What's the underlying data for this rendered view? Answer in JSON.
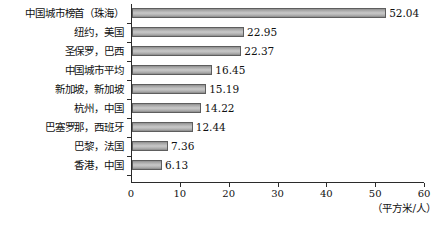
{
  "chart_data": {
    "type": "bar",
    "orientation": "horizontal",
    "title": "",
    "xlabel": "（平方米/人）",
    "ylabel": "",
    "xlim": [
      0,
      60
    ],
    "xticks": [
      "0",
      "10",
      "20",
      "30",
      "40",
      "50",
      "60"
    ],
    "xtick_values": [
      0,
      10,
      20,
      30,
      40,
      50,
      60
    ],
    "grid": false,
    "legend": false,
    "bar_color": "#b0b0b0",
    "bar_border_color": "#5e5e5e",
    "axis_color": "#2b2b2b",
    "categories": [
      "中国城市榜首（珠海）",
      "纽约，美国",
      "圣保罗，巴西",
      "中国城市平均",
      "新加坡，新加坡",
      "杭州，中国",
      "巴塞罗那，西班牙",
      "巴黎，法国",
      "香港，中国"
    ],
    "values": [
      52.04,
      22.95,
      22.37,
      16.45,
      15.19,
      14.22,
      12.44,
      7.36,
      6.13
    ],
    "value_labels": [
      "52.04",
      "22.95",
      "22.37",
      "16.45",
      "15.19",
      "14.22",
      "12.44",
      "7.36",
      "6.13"
    ]
  },
  "unit_caption": "（平方米/人）"
}
